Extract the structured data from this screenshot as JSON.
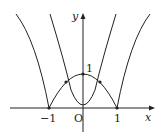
{
  "diagram": {
    "axes": {
      "x_label": "x",
      "y_label": "y",
      "origin_label": "O"
    },
    "ticks": {
      "x_neg": "−1",
      "x_pos": "1",
      "y_top": "1"
    },
    "curves": [
      {
        "name": "outer",
        "equation": "y = |x² − 1| (|x| ≥ 1 shown)"
      },
      {
        "name": "cap",
        "equation": "y = 1 − x² (−1 ≤ x ≤ 1)"
      },
      {
        "name": "inner",
        "equation": "y = 3x²"
      }
    ],
    "marked_points": [
      [
        -1,
        0
      ],
      [
        1,
        0
      ],
      [
        0,
        1
      ],
      [
        0,
        0
      ],
      [
        -0.5,
        0.75
      ],
      [
        0.5,
        0.75
      ]
    ],
    "line_color": "#222222"
  }
}
